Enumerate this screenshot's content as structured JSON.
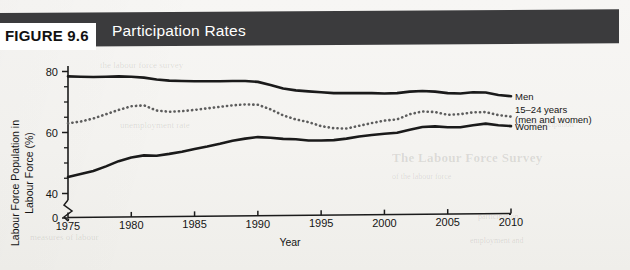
{
  "figure": {
    "tag": "FIGURE 9.6",
    "title": "Participation Rates"
  },
  "bleed_through": {
    "line1": "The Labour Force Survey",
    "line2": "of the labour force",
    "line3": "participation",
    "line4": "employment and",
    "line5": "the labour force survey",
    "line6": "unemployment rate",
    "line7": "measures of labour",
    "line8": "force participation"
  },
  "colors": {
    "banner": "#3b3b3d",
    "banner_text": "#ffffff",
    "tag_background": "#ffffff",
    "tag_text": "#111111",
    "paper": "#f6f5f3",
    "men_line": "#1a1a1a",
    "women_line": "#1a1a1a",
    "youth_line": "#5d5d5d",
    "axis": "#1b1b1b"
  },
  "chart_data": {
    "type": "line",
    "title": "Participation Rates",
    "xlabel": "Year",
    "ylabel": "Labour Force Population in Labour Force (%)",
    "ylabel_line1": "Labour Force Population in",
    "ylabel_line2": "Labour Force (%)",
    "xlim": [
      1975,
      2010
    ],
    "ylim": [
      38,
      84
    ],
    "y_axis_break": true,
    "y_break_label": "0",
    "grid": false,
    "legend_position": "right-inline",
    "xticks": [
      1975,
      1980,
      1985,
      1990,
      1995,
      2000,
      2005,
      2010
    ],
    "yticks": [
      40,
      60,
      80
    ],
    "yticks_minor": [
      45,
      50,
      55,
      65,
      70,
      75
    ],
    "x": [
      1975,
      1976,
      1977,
      1978,
      1979,
      1980,
      1981,
      1982,
      1983,
      1984,
      1985,
      1986,
      1987,
      1988,
      1989,
      1990,
      1991,
      1992,
      1993,
      1994,
      1995,
      1996,
      1997,
      1998,
      1999,
      2000,
      2001,
      2002,
      2003,
      2004,
      2005,
      2006,
      2007,
      2008,
      2009,
      2010
    ],
    "series": [
      {
        "name": "Men",
        "label": "Men",
        "style": "solid",
        "values": [
          78.4,
          78.3,
          78.2,
          78.3,
          78.4,
          78.3,
          78.0,
          77.4,
          77.0,
          76.9,
          76.8,
          76.8,
          76.8,
          76.9,
          76.9,
          76.6,
          75.6,
          74.4,
          73.8,
          73.5,
          73.2,
          72.9,
          72.9,
          72.9,
          72.9,
          72.8,
          72.9,
          73.4,
          73.6,
          73.4,
          72.9,
          72.8,
          73.2,
          73.1,
          72.3,
          71.9
        ]
      },
      {
        "name": "15–24 years (men and women)",
        "label_line1": "15–24 years",
        "label_line2": "(men and women)",
        "style": "dotted",
        "values": [
          63.0,
          63.6,
          64.6,
          66.0,
          67.4,
          68.6,
          68.9,
          67.2,
          66.8,
          67.0,
          67.4,
          67.9,
          68.4,
          68.9,
          69.2,
          69.1,
          67.6,
          65.6,
          64.3,
          63.4,
          62.1,
          61.4,
          61.3,
          62.2,
          63.1,
          63.9,
          64.3,
          66.0,
          66.9,
          66.7,
          65.8,
          66.0,
          66.6,
          66.7,
          65.7,
          65.2
        ]
      },
      {
        "name": "Women",
        "label": "Women",
        "style": "solid",
        "values": [
          45.4,
          46.4,
          47.4,
          48.9,
          50.6,
          51.8,
          52.5,
          52.4,
          53.0,
          53.7,
          54.6,
          55.4,
          56.3,
          57.3,
          58.0,
          58.5,
          58.3,
          57.9,
          57.8,
          57.4,
          57.4,
          57.5,
          58.0,
          58.7,
          59.2,
          59.6,
          59.9,
          60.9,
          61.8,
          62.0,
          61.7,
          61.7,
          62.4,
          62.9,
          62.4,
          62.1
        ]
      }
    ]
  }
}
